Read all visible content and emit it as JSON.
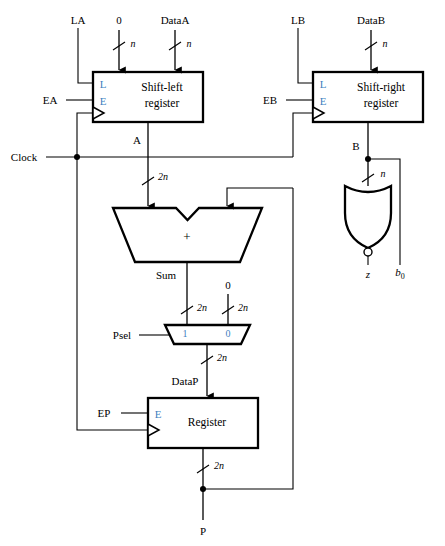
{
  "figure": {
    "type": "digital-circuit-block-diagram"
  },
  "signals": {
    "la": "LA",
    "zero_a": "0",
    "data_a": "DataA",
    "ea": "EA",
    "lb": "LB",
    "data_b": "DataB",
    "eb": "EB",
    "clock": "Clock",
    "a": "A",
    "b": "B",
    "sum": "Sum",
    "zero_mux": "0",
    "psel": "Psel",
    "datap": "DataP",
    "ep": "EP",
    "p": "P",
    "z": "z",
    "b0": "b",
    "b0_sub": "0"
  },
  "blocks": {
    "shift_left": {
      "line1": "Shift-left",
      "line2": "register",
      "port_load": "L",
      "port_enable": "E"
    },
    "shift_right": {
      "line1": "Shift-right",
      "line2": "register",
      "port_load": "L",
      "port_enable": "E"
    },
    "adder": {
      "symbol": "+"
    },
    "mux": {
      "in_one": "1",
      "in_zero": "0"
    },
    "register": {
      "label": "Register",
      "port_enable": "E"
    },
    "nor_gate": {
      "name": "nor-gate"
    }
  },
  "bus_widths": {
    "n": "n",
    "two_n": "2n"
  },
  "colors": {
    "wire": "#000000",
    "port_label": "#3f7fbf",
    "background": "#ffffff"
  }
}
